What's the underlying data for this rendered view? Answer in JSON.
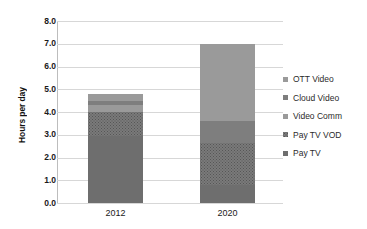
{
  "chart_data": {
    "type": "bar",
    "stacked": true,
    "title": "",
    "xlabel": "",
    "ylabel": "Hours per day",
    "categories": [
      "2012",
      "2020"
    ],
    "ylim": [
      0.0,
      8.0
    ],
    "ytick_step": 1.0,
    "ytick_labels": [
      "8.0",
      "7.0",
      "6.0",
      "5.0",
      "4.0",
      "3.0",
      "2.0",
      "1.0",
      "0.0"
    ],
    "grid": "horizontal",
    "legend_position": "right",
    "totals": [
      4.8,
      7.0
    ],
    "series": [
      {
        "name": "OTT Video",
        "values": [
          0.3,
          3.4
        ],
        "color": "#9a9a9a",
        "texture": "solid-light"
      },
      {
        "name": "Cloud Video",
        "values": [
          0.2,
          0.95
        ],
        "color": "#7e7e7e",
        "texture": "solid-mid"
      },
      {
        "name": "Video Comm",
        "values": [
          0.3,
          0.0
        ],
        "color": "#8c8c8c",
        "texture": "solid-light"
      },
      {
        "name": "Pay TV VOD",
        "values": [
          1.05,
          1.85
        ],
        "color": "#7a7a7a",
        "texture": "dotted"
      },
      {
        "name": "Pay TV",
        "values": [
          2.95,
          0.8
        ],
        "color": "#6e6e6e",
        "texture": "solid-dark"
      }
    ]
  },
  "legend": {
    "items": [
      {
        "label": "OTT Video"
      },
      {
        "label": "Cloud Video"
      },
      {
        "label": "Video Comm"
      },
      {
        "label": "Pay TV VOD"
      },
      {
        "label": "Pay TV"
      }
    ]
  },
  "axis": {
    "y_title": "Hours per day",
    "y_ticks": [
      "8.0",
      "7.0",
      "6.0",
      "5.0",
      "4.0",
      "3.0",
      "2.0",
      "1.0",
      "0.0"
    ],
    "x_ticks": [
      "2012",
      "2020"
    ]
  }
}
